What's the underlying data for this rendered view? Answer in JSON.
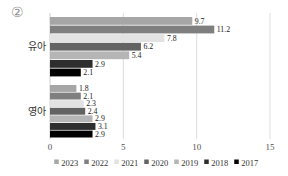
{
  "figure": {
    "marker": "②",
    "background": "#ffffff"
  },
  "chart_data": {
    "type": "bar",
    "orientation": "horizontal",
    "title": "",
    "xlabel": "",
    "ylabel": "",
    "categories": [
      "유아",
      "영아"
    ],
    "series": [
      {
        "name": "2023",
        "color": "#a6a6a6",
        "values": [
          9.7,
          1.8
        ]
      },
      {
        "name": "2022",
        "color": "#7f7f7f",
        "values": [
          11.2,
          2.1
        ]
      },
      {
        "name": "2021",
        "color": "#e2e2e2",
        "values": [
          7.8,
          2.3
        ]
      },
      {
        "name": "2020",
        "color": "#636363",
        "values": [
          6.2,
          2.4
        ]
      },
      {
        "name": "2019",
        "color": "#b5b5b5",
        "values": [
          5.4,
          2.9
        ]
      },
      {
        "name": "2018",
        "color": "#2e2e2e",
        "values": [
          2.9,
          3.1
        ]
      },
      {
        "name": "2017",
        "color": "#000000",
        "values": [
          2.1,
          2.9
        ]
      }
    ],
    "xlim": [
      0,
      15
    ],
    "xticks": [
      "0",
      "5",
      "10",
      "15"
    ],
    "grid": true,
    "value_labels": true,
    "legend_position": "bottom",
    "legend_entries": [
      "2023",
      "2022",
      "2021",
      "2020",
      "2019",
      "2018",
      "2017"
    ]
  },
  "colors": {
    "gridline": "#dddddd",
    "axis_line": "#cccccc",
    "tick_text": "#555555",
    "value_text": "#1a1a1a",
    "category_text": "#333333",
    "legend_text": "#333333",
    "marker_text": "#8f8f8f"
  }
}
